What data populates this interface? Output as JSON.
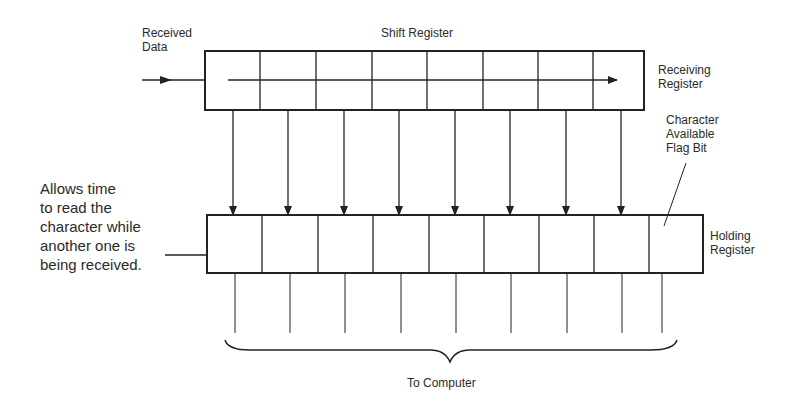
{
  "labels": {
    "received_data": [
      "Received",
      "Data"
    ],
    "shift_register": "Shift Register",
    "receiving_register": [
      "Receiving",
      "Register"
    ],
    "flag_bit": [
      "Character",
      "Available",
      "Flag Bit"
    ],
    "holding_register": [
      "Holding",
      "Register"
    ],
    "note": [
      "Allows time",
      "to read the",
      "character while",
      "another one is",
      "being received."
    ],
    "to_computer": "To Computer"
  },
  "diagram": {
    "receiving_register_cells": 8,
    "holding_register_cells": 9,
    "transfer_arrows": 8,
    "output_lines": 9,
    "line_color": "#222222"
  }
}
